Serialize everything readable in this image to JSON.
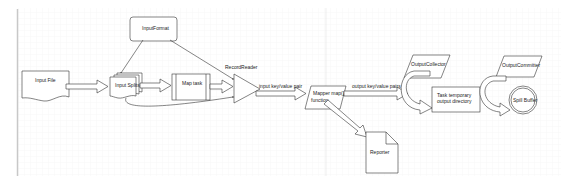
{
  "diagram": {
    "nodes": {
      "input_file": {
        "label": "Input File",
        "shape": "document"
      },
      "input_format": {
        "label": "InputFormat",
        "shape": "rounded-rect"
      },
      "input_splits": {
        "label": "Input Splits",
        "shape": "multi-document"
      },
      "map_task": {
        "label": "Map task",
        "shape": "process"
      },
      "record_reader": {
        "label": "RecordReader",
        "shape": "triangle"
      },
      "mapper": {
        "label_line1": "Mapper map()",
        "label_line2": "function",
        "shape": "parallelogram"
      },
      "reporter": {
        "label": "Reporter",
        "shape": "note"
      },
      "output_collector": {
        "label": "OutputCollector",
        "shape": "parallelogram"
      },
      "task_temp_dir": {
        "label_line1": "Task temporary",
        "label_line2": "output directory",
        "shape": "rect"
      },
      "output_committer": {
        "label": "OutputCommitter",
        "shape": "parallelogram"
      },
      "spill_buffer": {
        "label": "Spill Buffer",
        "shape": "double-circle"
      }
    },
    "edges": {
      "input_kv": {
        "label": "input key/value pair"
      },
      "output_kv": {
        "label": "output key/value pairs"
      }
    }
  },
  "colors": {
    "stroke": "#333333",
    "background": "#ffffff",
    "grid": "#eeeeee",
    "border": "#cccccc"
  }
}
